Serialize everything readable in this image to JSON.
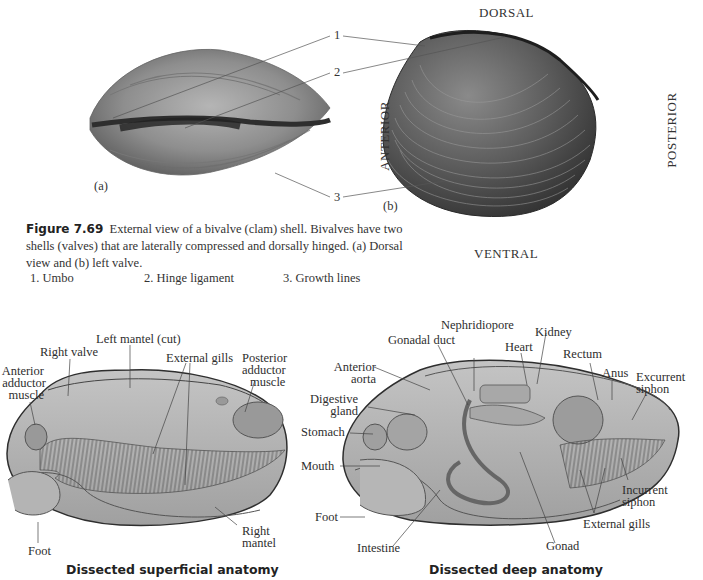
{
  "figure": {
    "number": "Figure 7.69",
    "caption": "External view of a bivalve (clam) shell. Bivalves have two shells (valves) that are laterally compressed and dorsally hinged. (a) Dorsal view and (b) left valve.",
    "panel_a_label": "(a)",
    "panel_b_label": "(b)",
    "callout_numbers": [
      "1",
      "2",
      "3"
    ],
    "orientation": {
      "dorsal": "DORSAL",
      "ventral": "VENTRAL",
      "anterior": "ANTERIOR",
      "posterior": "POSTERIOR"
    },
    "legend": [
      {
        "num": "1.",
        "text": "Umbo"
      },
      {
        "num": "2.",
        "text": "Hinge ligament"
      },
      {
        "num": "3.",
        "text": "Growth lines"
      }
    ]
  },
  "superficial": {
    "title": "Dissected superficial anatomy",
    "labels": {
      "left_mantel": "Left mantel (cut)",
      "right_valve": "Right valve",
      "anterior_adductor_1": "Anterior",
      "anterior_adductor_2": "adductor",
      "anterior_adductor_3": "muscle",
      "external_gills": "External gills",
      "posterior_adductor_1": "Posterior",
      "posterior_adductor_2": "adductor",
      "posterior_adductor_3": "muscle",
      "right_mantel_1": "Right",
      "right_mantel_2": "mantel",
      "foot": "Foot"
    }
  },
  "deep": {
    "title": "Dissected deep anatomy",
    "labels": {
      "nephridiopore": "Nephridiopore",
      "gonadal_duct": "Gonadal duct",
      "kidney": "Kidney",
      "heart": "Heart",
      "rectum": "Rectum",
      "anterior_aorta_1": "Anterior",
      "anterior_aorta_2": "aorta",
      "anus": "Anus",
      "excurrent_1": "Excurrent",
      "excurrent_2": "siphon",
      "digestive_1": "Digestive",
      "digestive_2": "gland",
      "stomach": "Stomach",
      "mouth": "Mouth",
      "incurrent_1": "Incurrent",
      "incurrent_2": "siphon",
      "foot": "Foot",
      "external_gills": "External gills",
      "intestine": "Intestine",
      "gonad": "Gonad"
    }
  }
}
